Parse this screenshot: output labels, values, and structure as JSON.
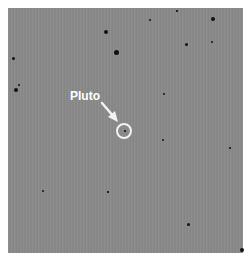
{
  "image": {
    "description": "Negative telescope star field image with Pluto circled",
    "background_color": "#8a8a8a",
    "annotation": {
      "label": "Pluto",
      "label_color": "#ffffff",
      "circle_center": [
        124,
        131
      ],
      "circle_radius": 8
    },
    "stars": [
      {
        "x": 213,
        "y": 19,
        "r": 2
      },
      {
        "x": 106,
        "y": 32,
        "r": 2
      },
      {
        "x": 116,
        "y": 52,
        "r": 2.5
      },
      {
        "x": 186,
        "y": 44,
        "r": 1.5
      },
      {
        "x": 212,
        "y": 42,
        "r": 1.2
      },
      {
        "x": 150,
        "y": 20,
        "r": 1
      },
      {
        "x": 177,
        "y": 11,
        "r": 0.8
      },
      {
        "x": 13,
        "y": 58,
        "r": 1.5
      },
      {
        "x": 16,
        "y": 90,
        "r": 2
      },
      {
        "x": 19,
        "y": 85,
        "r": 1
      },
      {
        "x": 164,
        "y": 94,
        "r": 1.2
      },
      {
        "x": 163,
        "y": 140,
        "r": 1
      },
      {
        "x": 43,
        "y": 191,
        "r": 1.2
      },
      {
        "x": 188,
        "y": 224,
        "r": 1.5
      },
      {
        "x": 242,
        "y": 250,
        "r": 2
      },
      {
        "x": 108,
        "y": 192,
        "r": 0.8
      },
      {
        "x": 230,
        "y": 148,
        "r": 0.8
      },
      {
        "x": 125,
        "y": 131,
        "r": 0.8
      }
    ]
  }
}
